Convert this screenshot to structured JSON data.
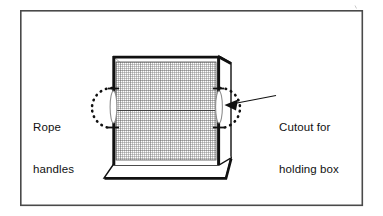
{
  "figure": {
    "kind": "line-diagram",
    "frame": {
      "name": "outer-border",
      "x": 20,
      "y": 10,
      "width": 343,
      "height": 196,
      "stroke": "#4a4a4a",
      "stroke_width": 1.6,
      "fill": "#ffffff"
    },
    "background_color": "#ffffff",
    "ink_color": "#111111",
    "mesh_color": "#6b6b6b"
  },
  "callouts": [
    {
      "id": "rope-handles",
      "lines": [
        "Rope",
        "handles"
      ],
      "line1": "Rope",
      "line2": "handles",
      "side": "left",
      "marker": "dotted-circle"
    },
    {
      "id": "cutout-holding-box",
      "lines": [
        "Cutout for",
        "holding box"
      ],
      "line1": "Cutout for",
      "line2": "holding box",
      "side": "right",
      "marker": "dotted-circle-with-arrow"
    }
  ],
  "box": {
    "name": "holding-box",
    "front_face": {
      "x1": 113,
      "y1": 56,
      "x2": 219,
      "y2": 165
    },
    "mesh": {
      "name": "mesh-screen",
      "x": 116,
      "y": 62,
      "width": 100,
      "height": 98,
      "cell_size": 2.0,
      "stroke": "#6e6e6e"
    },
    "handles": [
      {
        "id": "handle-left",
        "cx": 113,
        "cy": 107,
        "rx": 3.2,
        "ry": 16
      },
      {
        "id": "handle-right",
        "cx": 219,
        "cy": 107,
        "rx": 3.2,
        "ry": 16
      }
    ]
  },
  "annotations": {
    "left_circle": {
      "cx": 99,
      "cy": 108,
      "r": 20
    },
    "right_circle": {
      "cx": 233,
      "cy": 108,
      "r": 20
    },
    "leader_line": {
      "x1": 248,
      "y1": 101,
      "x2": 275,
      "y2": 94
    },
    "arrow_tip": {
      "x": 228,
      "y": 104
    },
    "tick_marks": 4
  }
}
